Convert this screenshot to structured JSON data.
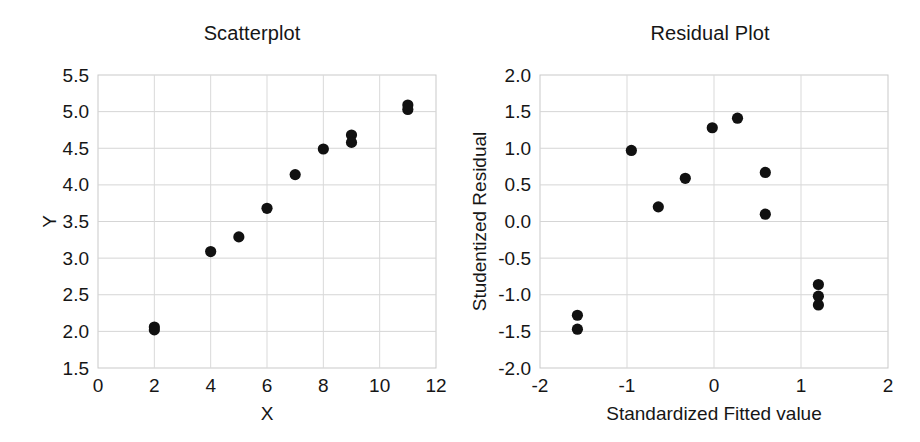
{
  "figure": {
    "background": "#ffffff",
    "dot_color": "#111111",
    "grid_color": "#d5d5d5",
    "frame_color": "#c9c9c9"
  },
  "chart_data": [
    {
      "type": "scatter",
      "title": "Scatterplot",
      "xlabel": "X",
      "ylabel": "Y",
      "xlim": [
        0,
        12
      ],
      "ylim": [
        1.5,
        5.5
      ],
      "xticks": [
        "0",
        "2",
        "4",
        "6",
        "8",
        "10",
        "12"
      ],
      "xtick_values": [
        0,
        2,
        4,
        6,
        8,
        10,
        12
      ],
      "yticks": [
        "1.5",
        "2.0",
        "2.5",
        "3.0",
        "3.5",
        "4.0",
        "4.5",
        "5.0",
        "5.5"
      ],
      "ytick_values": [
        1.5,
        2.0,
        2.5,
        3.0,
        3.5,
        4.0,
        4.5,
        5.0,
        5.5
      ],
      "grid": true,
      "legend": "none",
      "points": [
        {
          "x": 2,
          "y": 2.06
        },
        {
          "x": 2,
          "y": 2.02
        },
        {
          "x": 4,
          "y": 3.09
        },
        {
          "x": 5,
          "y": 3.29
        },
        {
          "x": 6,
          "y": 3.68
        },
        {
          "x": 7,
          "y": 4.14
        },
        {
          "x": 8,
          "y": 4.49
        },
        {
          "x": 9,
          "y": 4.68
        },
        {
          "x": 9,
          "y": 4.58
        },
        {
          "x": 11,
          "y": 5.09
        },
        {
          "x": 11,
          "y": 5.03
        }
      ]
    },
    {
      "type": "scatter",
      "title": "Residual Plot",
      "xlabel": "Standardized Fitted value",
      "ylabel": "Studentized Residual",
      "xlim": [
        -2,
        2
      ],
      "ylim": [
        -2.0,
        2.0
      ],
      "xticks": [
        "-2",
        "-1",
        "0",
        "1",
        "2"
      ],
      "xtick_values": [
        -2,
        -1,
        0,
        1,
        2
      ],
      "yticks": [
        "-2.0",
        "-1.5",
        "-1.0",
        "-0.5",
        "0.0",
        "0.5",
        "1.0",
        "1.5",
        "2.0"
      ],
      "ytick_values": [
        -2.0,
        -1.5,
        -1.0,
        -0.5,
        0.0,
        0.5,
        1.0,
        1.5,
        2.0
      ],
      "grid": true,
      "legend": "none",
      "points": [
        {
          "x": -1.57,
          "y": -1.28
        },
        {
          "x": -1.57,
          "y": -1.47
        },
        {
          "x": -0.95,
          "y": 0.97
        },
        {
          "x": -0.64,
          "y": 0.2
        },
        {
          "x": -0.33,
          "y": 0.59
        },
        {
          "x": -0.02,
          "y": 1.28
        },
        {
          "x": 0.27,
          "y": 1.41
        },
        {
          "x": 0.59,
          "y": 0.67
        },
        {
          "x": 0.59,
          "y": 0.1
        },
        {
          "x": 1.2,
          "y": -0.86
        },
        {
          "x": 1.2,
          "y": -1.02
        },
        {
          "x": 1.2,
          "y": -1.14
        }
      ]
    }
  ]
}
